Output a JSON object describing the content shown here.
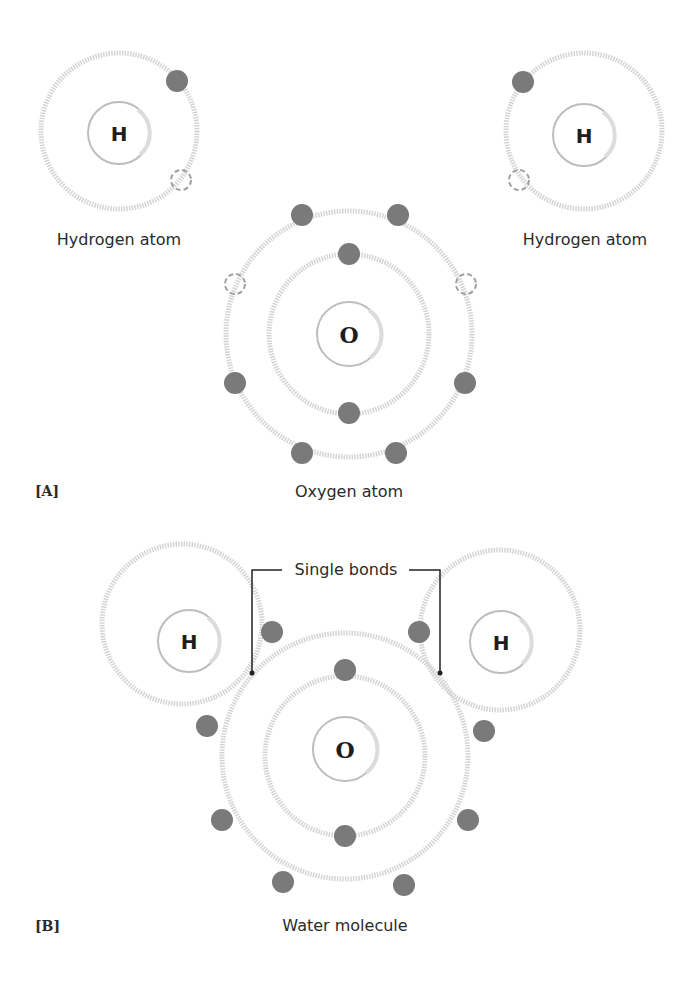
{
  "header": {
    "top_clipped_text": ""
  },
  "panel_a": {
    "tag": "[A]",
    "hydrogen_left": {
      "symbol": "H",
      "label": "Hydrogen atom",
      "electrons": 1,
      "vacancies": 1
    },
    "hydrogen_right": {
      "symbol": "H",
      "label": "Hydrogen atom",
      "electrons": 1,
      "vacancies": 1
    },
    "oxygen": {
      "symbol": "O",
      "label": "Oxygen atom",
      "inner_shell_electrons": 2,
      "outer_shell_electrons": 6,
      "vacancies": 2
    }
  },
  "panel_b": {
    "tag": "[B]",
    "callout": "Single bonds",
    "hydrogen_left": {
      "symbol": "H"
    },
    "hydrogen_right": {
      "symbol": "H"
    },
    "oxygen": {
      "symbol": "O"
    },
    "label": "Water molecule"
  },
  "colors": {
    "electron": "#7a7a7a",
    "shell": "#d4d4d4",
    "vacancy": "#a0a0a0",
    "text": "#2a2a2a"
  }
}
